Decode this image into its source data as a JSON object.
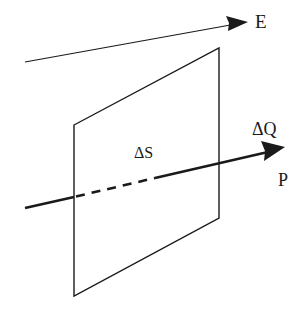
{
  "diagram": {
    "labels": {
      "E": "E",
      "delta_Q": "ΔQ",
      "delta_S": "ΔS",
      "P": "P"
    },
    "colors": {
      "stroke": "#1a1a1a",
      "background": "#ffffff"
    },
    "elements": {
      "field_line_E": {
        "from": [
          25,
          62
        ],
        "to": [
          248,
          22
        ]
      },
      "surface_dS": {
        "vertices": [
          [
            74,
            125
          ],
          [
            219,
            48
          ],
          [
            219,
            218
          ],
          [
            74,
            296
          ]
        ]
      },
      "axis_line_P": {
        "from": [
          25,
          208
        ],
        "to": [
          285,
          148
        ],
        "dashed_segment": [
          [
            74,
            198
          ],
          [
            155,
            178
          ]
        ]
      }
    }
  }
}
